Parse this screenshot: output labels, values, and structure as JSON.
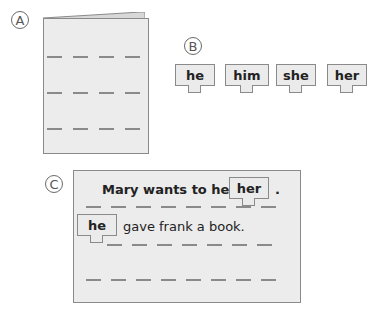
{
  "labels": {
    "a": "A",
    "b": "B",
    "c": "C"
  },
  "section_a": {
    "type": "folded-book",
    "dash_rows": 3,
    "dashes_per_row": 4
  },
  "section_b": {
    "word_tiles": [
      {
        "word": "he"
      },
      {
        "word": "him"
      },
      {
        "word": "she"
      },
      {
        "word": "her"
      }
    ]
  },
  "section_c": {
    "line1": {
      "text_before": "Mary wants to help",
      "tile_word": "her",
      "text_after": "."
    },
    "line2": {
      "tile_word": "he",
      "text_after": "gave frank a book."
    },
    "blank_lines": 1
  },
  "colors": {
    "paper": "#ececec",
    "border": "#8a8a8a",
    "text": "#222222"
  }
}
